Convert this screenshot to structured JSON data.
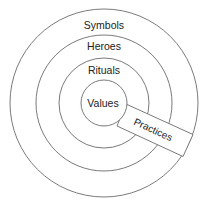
{
  "diagram": {
    "center": {
      "x": 104,
      "y": 103
    },
    "line_color": "#7a7a7a",
    "background": "#ffffff",
    "layers": [
      {
        "name": "symbols",
        "label": "Symbols",
        "radius": 94,
        "label_y": 29
      },
      {
        "name": "heroes",
        "label": "Heroes",
        "radius": 68,
        "label_y": 50
      },
      {
        "name": "rituals",
        "label": "Rituals",
        "radius": 45,
        "label_y": 74
      },
      {
        "name": "values",
        "label": "Values",
        "radius": 23,
        "label_y": 107
      }
    ],
    "practices": {
      "label": "Practices",
      "angle_deg": 24.5,
      "label_x": 153,
      "label_y": 133
    }
  }
}
